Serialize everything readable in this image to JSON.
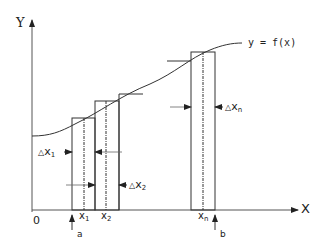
{
  "diagram": {
    "axes": {
      "y_label": "Y",
      "x_label": "X",
      "origin_label": "0"
    },
    "curve_label": "y = f(x)",
    "interval": {
      "start_label": "a",
      "end_label": "b"
    },
    "points": [
      {
        "label": "x",
        "sub": "1"
      },
      {
        "label": "x",
        "sub": "2"
      },
      {
        "label": "x",
        "sub": "n"
      }
    ],
    "widths": [
      {
        "prefix": "△",
        "label": "x",
        "sub": "1"
      },
      {
        "prefix": "△",
        "label": "x",
        "sub": "2"
      },
      {
        "prefix": "△",
        "label": "x",
        "sub": "n"
      }
    ],
    "colors": {
      "line": "#333333",
      "axis": "#555555",
      "background": "#ffffff"
    }
  }
}
